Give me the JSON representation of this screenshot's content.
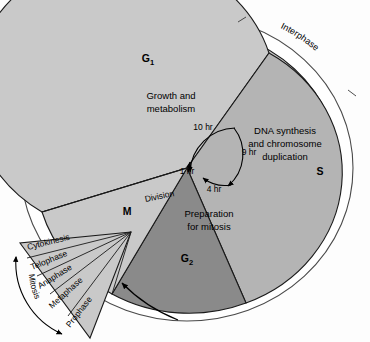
{
  "diagram": {
    "type": "cell-cycle-pie-diagram",
    "outer_ring": {
      "interphase_label": "Interphase",
      "division_label": "Division"
    },
    "sectors": [
      {
        "code": "G1",
        "code_main": "G",
        "code_sub": "1",
        "label_line1": "Growth and",
        "label_line2": "metabolism",
        "duration": "10 hr",
        "color": "#c9c9c9"
      },
      {
        "code": "S",
        "code_main": "S",
        "code_sub": "",
        "label_line1": "DNA synthesis",
        "label_line2": "and chromosome",
        "label_line3": "duplication",
        "duration": "9 hr",
        "color": "#b4b4b4"
      },
      {
        "code": "G2",
        "code_main": "G",
        "code_sub": "2",
        "label_line1": "Preparation",
        "label_line2": "for mitosis",
        "duration": "4 hr",
        "color": "#8a8a8a"
      },
      {
        "code": "M",
        "code_main": "M",
        "code_sub": "",
        "label_line1": "",
        "label_line2": "",
        "duration": "1 hr",
        "color": "#c9c9c9"
      }
    ],
    "time_labels": [
      "10 hr",
      "9 hr",
      "4 hr",
      "1 hr"
    ],
    "mitosis_fan": {
      "bracket_label": "Mitosis",
      "stages": [
        "Cytokinesis",
        "Telophase",
        "Anaphase",
        "Metaphase",
        "Prophase"
      ],
      "color": "#c9c9c9"
    },
    "colors": {
      "background": "#fdfdfd",
      "outline": "#1a1a1a",
      "ring_fill": "#ffffff",
      "g1_fill": "#c9c9c9",
      "s_fill": "#b4b4b4",
      "g2_fill": "#8a8a8a",
      "m_fill": "#c9c9c9",
      "fan_fill": "#c9c9c9",
      "text": "#000000"
    }
  }
}
